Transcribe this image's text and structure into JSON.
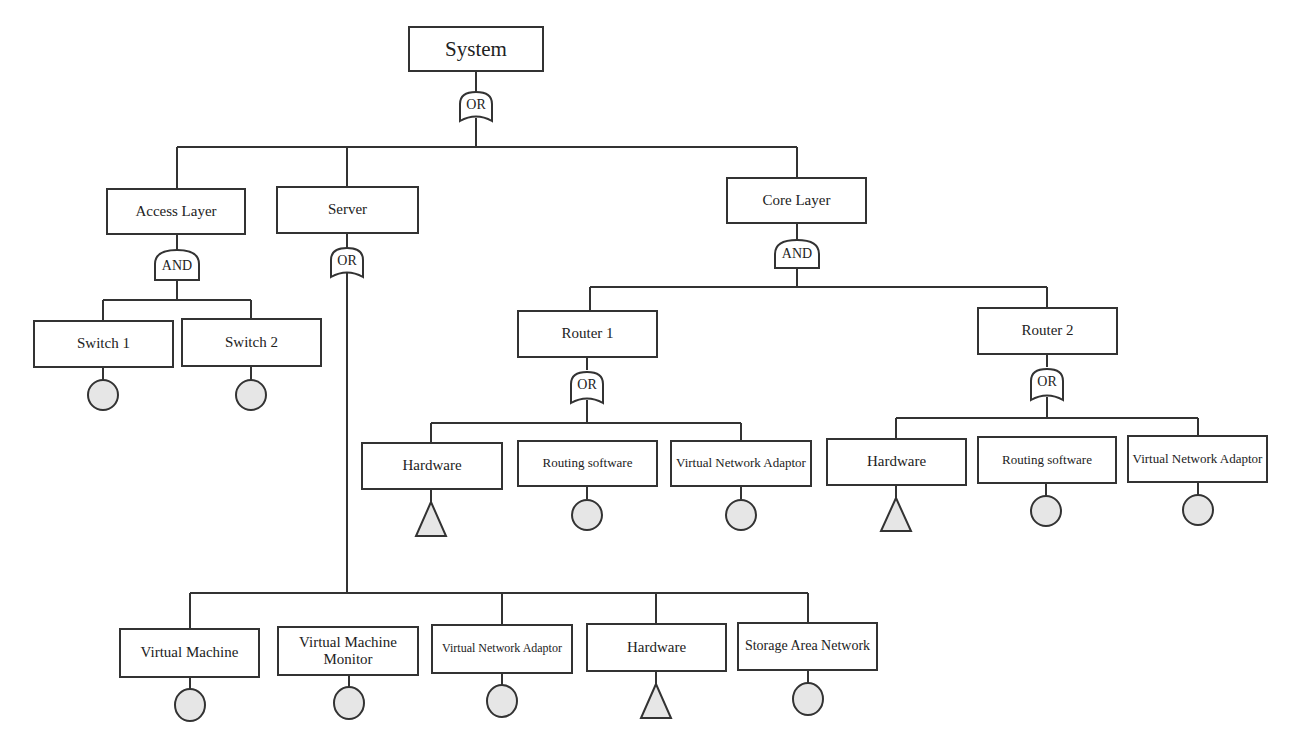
{
  "diagram": {
    "type": "fault-tree",
    "colors": {
      "line": "#333333",
      "fill_basic": "#e6e6e6",
      "background": "#ffffff"
    },
    "top": {
      "label": "System",
      "gate": "OR"
    },
    "level1": {
      "access_layer": {
        "label": "Access Layer",
        "gate": "AND",
        "children": [
          {
            "label": "Switch 1",
            "event": "circle"
          },
          {
            "label": "Switch 2",
            "event": "circle"
          }
        ]
      },
      "server": {
        "label": "Server",
        "gate": "OR",
        "children": [
          {
            "label": "Virtual Machine",
            "event": "circle"
          },
          {
            "label": "Virtual Machine Monitor",
            "event": "circle"
          },
          {
            "label": "Virtual Network Adaptor",
            "event": "circle"
          },
          {
            "label": "Hardware",
            "event": "triangle"
          },
          {
            "label": "Storage Area Network",
            "event": "circle"
          }
        ]
      },
      "core_layer": {
        "label": "Core Layer",
        "gate": "AND",
        "routers": [
          {
            "label": "Router 1",
            "gate": "OR",
            "children": [
              {
                "label": "Hardware",
                "event": "triangle"
              },
              {
                "label": "Routing software",
                "event": "circle"
              },
              {
                "label": "Virtual Network Adaptor",
                "event": "circle"
              }
            ]
          },
          {
            "label": "Router 2",
            "gate": "OR",
            "children": [
              {
                "label": "Hardware",
                "event": "triangle"
              },
              {
                "label": "Routing software",
                "event": "circle"
              },
              {
                "label": "Virtual Network Adaptor",
                "event": "circle"
              }
            ]
          }
        ]
      }
    }
  }
}
